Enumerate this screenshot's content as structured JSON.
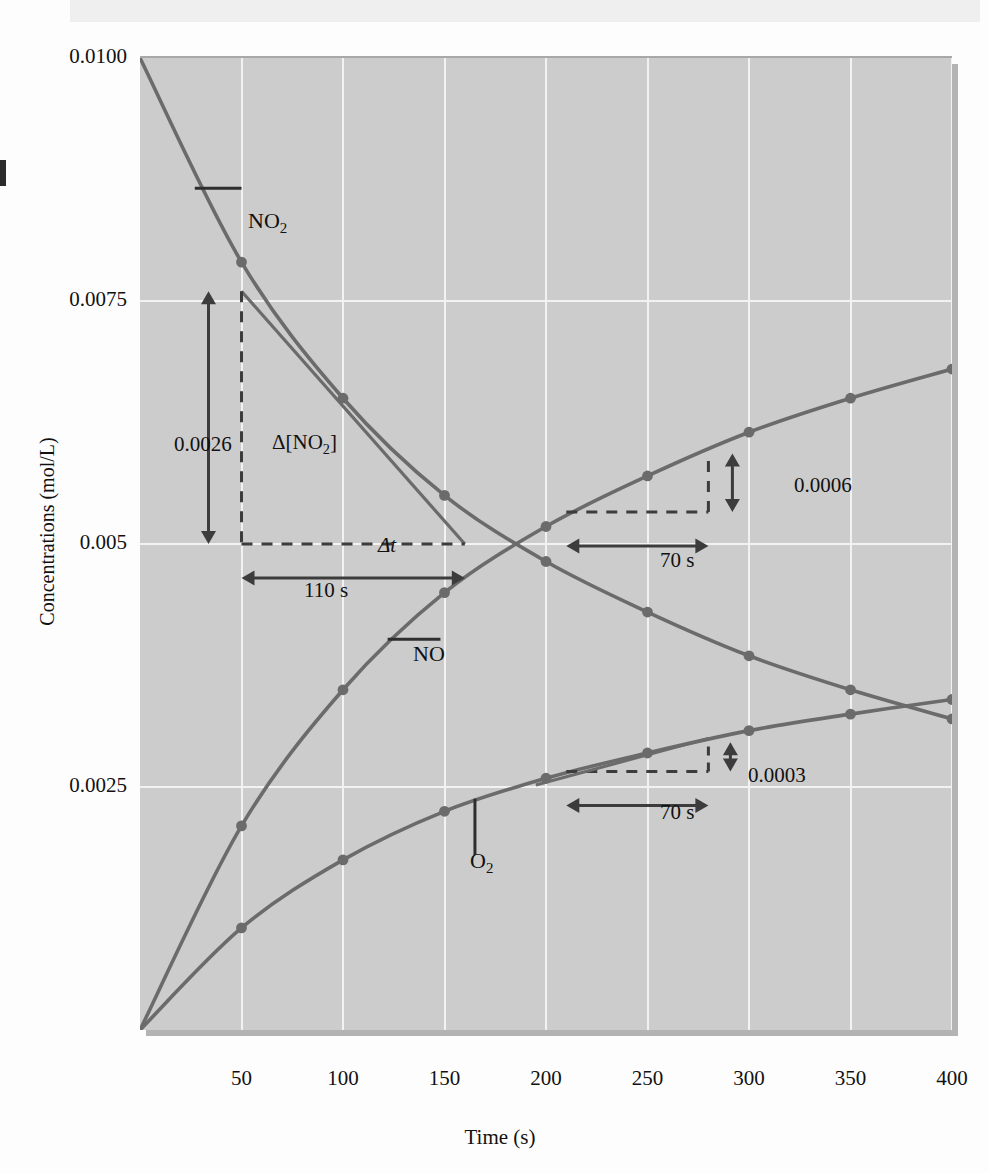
{
  "figure": {
    "title": "",
    "y_axis_label": "Concentrations (mol/L)",
    "x_axis_label": "Time (s)"
  },
  "chart_data": {
    "type": "line",
    "title": "",
    "xlabel": "Time (s)",
    "ylabel": "Concentrations (mol/L)",
    "xlim": [
      0,
      400
    ],
    "ylim": [
      0,
      0.01
    ],
    "xticks": [
      50,
      100,
      150,
      200,
      250,
      300,
      350,
      400
    ],
    "ytick_labels": [
      "0.0100",
      "0.0075",
      "0.005",
      "0.0025"
    ],
    "yticks": [
      0.01,
      0.0075,
      0.005,
      0.0025
    ],
    "grid": true,
    "legend": "inline-labels",
    "x": [
      0,
      50,
      100,
      150,
      200,
      250,
      300,
      350,
      400
    ],
    "series": [
      {
        "name": "NO2",
        "label": "NO₂",
        "color": "#6b6b6b",
        "values": [
          0.01,
          0.0079,
          0.0065,
          0.0055,
          0.00482,
          0.0043,
          0.00385,
          0.0035,
          0.0032
        ]
      },
      {
        "name": "NO",
        "label": "NO",
        "color": "#6b6b6b",
        "values": [
          0.0,
          0.0021,
          0.0035,
          0.0045,
          0.00518,
          0.0057,
          0.00615,
          0.0065,
          0.0068
        ]
      },
      {
        "name": "O2",
        "label": "O₂",
        "color": "#6b6b6b",
        "values": [
          0.0,
          0.00105,
          0.00175,
          0.00225,
          0.00259,
          0.00285,
          0.00308,
          0.00325,
          0.0034
        ]
      }
    ],
    "annotations": [
      {
        "id": "no2-tangent",
        "series": "NO2",
        "delta_y_label": "0.0026",
        "delta_y_symbol": "Δ[NO₂]",
        "delta_t_symbol": "Δt",
        "delta_t_label": "110 s",
        "x_from": 50,
        "x_to": 160,
        "y_from": 0.0076,
        "y_to": 0.005
      },
      {
        "id": "no-tangent",
        "series": "NO",
        "delta_y_label": "0.0006",
        "delta_t_label": "70 s",
        "x_from": 210,
        "x_to": 280,
        "y_from": 0.00533,
        "y_to": 0.00593
      },
      {
        "id": "o2-tangent",
        "series": "O2",
        "delta_y_label": "0.0003",
        "delta_t_label": "70 s",
        "x_from": 210,
        "x_to": 280,
        "y_from": 0.00266,
        "y_to": 0.00296
      }
    ]
  },
  "colors": {
    "plot_background": "#cccccc",
    "gridline": "#f2f2f2",
    "curve": "#6b6b6b",
    "annotation": "#3c3c3c",
    "text": "#111111"
  }
}
